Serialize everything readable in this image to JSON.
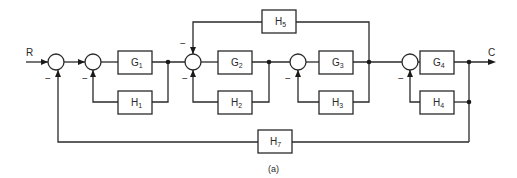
{
  "diagram": {
    "type": "block-diagram",
    "input_label": "R",
    "output_label": "C",
    "caption": "(a)",
    "colors": {
      "line": "#2a2a2a",
      "background": "#ffffff"
    },
    "forward_blocks": [
      {
        "id": "G1",
        "name": "G",
        "sub": "1"
      },
      {
        "id": "G2",
        "name": "G",
        "sub": "2"
      },
      {
        "id": "G3",
        "name": "G",
        "sub": "3"
      },
      {
        "id": "G4",
        "name": "G",
        "sub": "4"
      }
    ],
    "feedback_blocks": [
      {
        "id": "H1",
        "name": "H",
        "sub": "1"
      },
      {
        "id": "H2",
        "name": "H",
        "sub": "2"
      },
      {
        "id": "H3",
        "name": "H",
        "sub": "3"
      },
      {
        "id": "H4",
        "name": "H",
        "sub": "4"
      },
      {
        "id": "H5",
        "name": "H",
        "sub": "5"
      },
      {
        "id": "H7",
        "name": "H",
        "sub": "7"
      }
    ],
    "summing_junctions": [
      {
        "id": "S1",
        "sign": "−",
        "feedback_from": "H7"
      },
      {
        "id": "S2",
        "sign": "−",
        "feedback_from": "H1"
      },
      {
        "id": "S3",
        "sign_top": "−",
        "sign_bottom": "−",
        "feedback_from": [
          "H5",
          "H2"
        ]
      },
      {
        "id": "S4",
        "sign": "−",
        "feedback_from": "H3"
      },
      {
        "id": "S5",
        "sign": "−",
        "feedback_from": "H4"
      }
    ],
    "connections": [
      "R -> S1",
      "S1 -> S2",
      "S2 -> G1",
      "G1 -> S3",
      "G1 -> H1 -> S2",
      "S3 -> G2",
      "G2 -> S4",
      "G2 -> H2 -> S3",
      "S4 -> G3",
      "G3 -> S5",
      "G3 -> H3 -> S4",
      "G3 -> H5 -> S3",
      "S5 -> G4",
      "G4 -> C",
      "C -> H4 -> S5",
      "C -> H7 -> S1"
    ]
  }
}
